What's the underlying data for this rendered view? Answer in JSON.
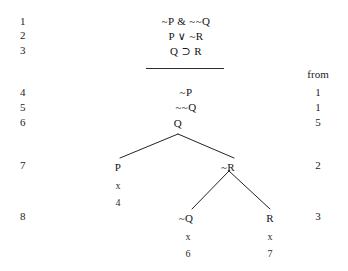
{
  "document": {
    "type": "truth-tree-proof",
    "background_color": "#ffffff",
    "ink_color": "#1d1d20"
  },
  "columns": {
    "from_header": "from"
  },
  "rows": [
    {
      "number": "1",
      "formula": "~P & ~~Q",
      "from": ""
    },
    {
      "number": "2",
      "formula": "P ∨ ~R",
      "from": ""
    },
    {
      "number": "3",
      "formula": "Q ⊃ R",
      "from": ""
    },
    {
      "number": "4",
      "formula": "~P",
      "from": "1"
    },
    {
      "number": "5",
      "formula": "~~Q",
      "from": "1"
    },
    {
      "number": "6",
      "formula": "Q",
      "from": "5"
    },
    {
      "number": "7",
      "formula": "",
      "from": "2"
    },
    {
      "number": "8",
      "formula": "",
      "from": "3"
    }
  ],
  "tree": {
    "root": {
      "label": "Q",
      "x": 178,
      "y": 131
    },
    "branches": [
      {
        "label": "P",
        "x": 118,
        "y": 162,
        "closed": true,
        "closure_mark": "x",
        "closure_line": "4"
      },
      {
        "label": "~R",
        "x": 228,
        "y": 162,
        "closed": false,
        "closure_mark": "",
        "closure_line": ""
      },
      {
        "label": "~Q",
        "x": 186,
        "y": 213,
        "closed": true,
        "closure_mark": "x",
        "closure_line": "6"
      },
      {
        "label": "R",
        "x": 270,
        "y": 213,
        "closed": true,
        "closure_mark": "x",
        "closure_line": "7"
      }
    ]
  }
}
